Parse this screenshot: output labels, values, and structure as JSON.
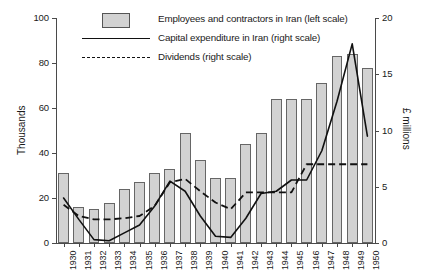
{
  "legend": {
    "items": [
      {
        "label": "Employees and contractors in Iran (left scale)",
        "marker": "bar-swatch"
      },
      {
        "label": "Capital expenditure in Iran (right scale)",
        "marker": "solid-line"
      },
      {
        "label": "Dividends (right scale)",
        "marker": "dashed-line"
      }
    ]
  },
  "axes": {
    "left_title": "Thousands",
    "right_title": "£ millions",
    "left_ticks": [
      "0",
      "20",
      "40",
      "60",
      "80",
      "100"
    ],
    "right_ticks": [
      "0",
      "5",
      "10",
      "15",
      "20"
    ]
  },
  "chart_data": {
    "type": "bar",
    "title": "",
    "subtitle": "",
    "xlabel": "",
    "ylabel": "Thousands",
    "y2label": "£ millions",
    "ylim": [
      0,
      100
    ],
    "y2lim": [
      0,
      20
    ],
    "grid": false,
    "legend_position": "top-left",
    "categories": [
      "1930",
      "1931",
      "1932",
      "1933",
      "1934",
      "1935",
      "1936",
      "1937",
      "1938",
      "1939",
      "1940",
      "1941",
      "1942",
      "1943",
      "1944",
      "1945",
      "1946",
      "1947",
      "1948",
      "1949",
      "1950"
    ],
    "series": [
      {
        "name": "Employees and contractors in Iran (left scale)",
        "type": "bar",
        "axis": "left",
        "unit": "thousands",
        "values": [
          31,
          16,
          15,
          18,
          24,
          27,
          31,
          33,
          49,
          37,
          29,
          29,
          44,
          49,
          64,
          64,
          64,
          71,
          83,
          84,
          78
        ]
      },
      {
        "name": "Capital expenditure in Iran (right scale)",
        "type": "line",
        "axis": "right",
        "unit": "£ millions",
        "values": [
          4.0,
          2.1,
          0.3,
          0.2,
          0.9,
          1.6,
          3.3,
          5.5,
          4.6,
          2.4,
          0.6,
          0.5,
          2.2,
          4.4,
          4.6,
          5.6,
          5.6,
          8.2,
          12.6,
          17.7,
          9.5
        ]
      },
      {
        "name": "Dividends (right scale)",
        "type": "line",
        "axis": "right",
        "unit": "£ millions",
        "values": [
          3.4,
          2.4,
          2.1,
          2.1,
          2.2,
          2.4,
          3.3,
          5.4,
          5.7,
          4.6,
          3.6,
          3.0,
          4.5,
          4.5,
          4.5,
          4.5,
          7.0,
          7.0,
          7.0,
          7.0,
          7.0
        ]
      }
    ]
  }
}
